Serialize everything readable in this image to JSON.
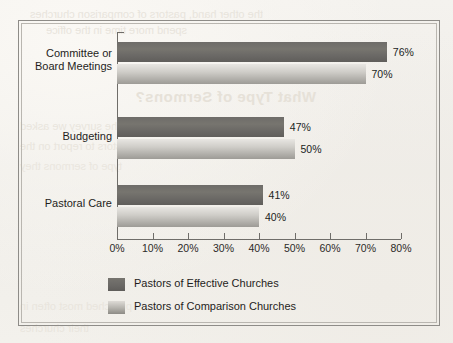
{
  "chart_data": {
    "type": "bar",
    "orientation": "horizontal",
    "title": "",
    "xlabel": "",
    "ylabel": "",
    "categories": [
      "Committee or\nBoard Meetings",
      "Budgeting",
      "Pastoral Care"
    ],
    "series": [
      {
        "name": "Pastors of Effective Churches",
        "values": [
          76,
          50,
          41
        ],
        "value_labels": [
          "76%",
          "47%",
          "41%"
        ],
        "color": "#6a6865"
      },
      {
        "name": "Pastors of Comparison Churches",
        "values": [
          70,
          50,
          40
        ],
        "value_labels": [
          "70%",
          "50%",
          "40%"
        ],
        "color": "#b4b2ac"
      }
    ],
    "xlim": [
      0,
      80
    ],
    "xticks": [
      0,
      10,
      20,
      30,
      40,
      50,
      60,
      70,
      80
    ],
    "xtick_labels": [
      "0%",
      "10%",
      "20%",
      "30%",
      "40%",
      "50%",
      "60%",
      "70%",
      "80%"
    ],
    "grid": false,
    "legend_position": "bottom"
  },
  "bars": [
    {
      "value_label": "76%",
      "value": 76,
      "series": "effective",
      "top": 42
    },
    {
      "value_label": "70%",
      "value": 70,
      "series": "comparison",
      "top": 64
    },
    {
      "value_label": "47%",
      "value": 47,
      "series": "effective",
      "top": 117
    },
    {
      "value_label": "50%",
      "value": 50,
      "series": "comparison",
      "top": 139
    },
    {
      "value_label": "41%",
      "value": 41,
      "series": "effective",
      "top": 185
    },
    {
      "value_label": "40%",
      "value": 40,
      "series": "comparison",
      "top": 207
    }
  ],
  "categories": [
    {
      "label": "Committee or\nBoard Meetings",
      "top": 47
    },
    {
      "label": "Budgeting",
      "top": 130
    },
    {
      "label": "Pastoral Care",
      "top": 197
    }
  ],
  "xticks": [
    {
      "label": "0%",
      "value": 0
    },
    {
      "label": "10%",
      "value": 10
    },
    {
      "label": "20%",
      "value": 20
    },
    {
      "label": "30%",
      "value": 30
    },
    {
      "label": "40%",
      "value": 40
    },
    {
      "label": "50%",
      "value": 50
    },
    {
      "label": "60%",
      "value": 60
    },
    {
      "label": "70%",
      "value": 70
    },
    {
      "label": "80%",
      "value": 80
    }
  ],
  "legend": [
    {
      "label": "Pastors of Effective Churches",
      "series": "effective",
      "top": 278
    },
    {
      "label": "Pastors of Comparison Churches",
      "series": "comparison",
      "top": 301
    }
  ],
  "bleed_through": {
    "title": "What Type of Sermons?",
    "line1": "the other hand, pastors of comparison churches",
    "line2": "spend more time in the office",
    "line3": "In the survey we asked",
    "line4": "pastors to report on the",
    "line5": "type of sermons they",
    "line6": "preached most often in",
    "line7": "their churches"
  },
  "colors": {
    "effective": "#6a6865",
    "comparison": "#b4b2ac",
    "axis": "#6f6d69",
    "text": "#1f1d1b",
    "paper": "#f2f0ec",
    "frame_outer": "#8e8c88",
    "frame_inner": "#b9b6b0"
  }
}
